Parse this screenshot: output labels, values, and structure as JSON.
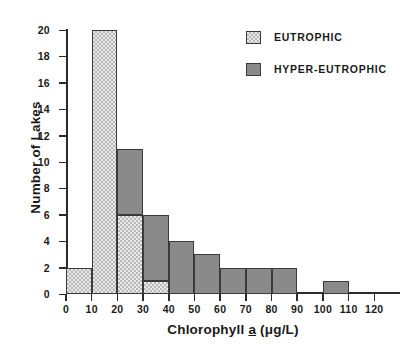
{
  "chart_data": {
    "type": "bar",
    "title": "",
    "subtitle": "",
    "xlabel": "Chlorophyll a (μg/L)",
    "xlabel_parts": {
      "prefix": "Chlorophyll ",
      "italic_underlined": "a",
      "suffix": " (μg/L)"
    },
    "ylabel": "Number of Lakes",
    "stacked": true,
    "grid": false,
    "legend_position": "top-right",
    "xlim": [
      0,
      130
    ],
    "ylim": [
      0,
      20
    ],
    "xticks": [
      0,
      10,
      20,
      30,
      40,
      50,
      60,
      70,
      80,
      90,
      100,
      110,
      120
    ],
    "xtick_labels": [
      "0",
      "10",
      "20",
      "30",
      "40",
      "50",
      "60",
      "70",
      "80",
      "90",
      "100",
      "110",
      "120"
    ],
    "yticks": [
      0,
      2,
      4,
      6,
      8,
      10,
      12,
      14,
      16,
      18,
      20
    ],
    "ytick_labels": [
      "0",
      "2",
      "4",
      "6",
      "8",
      "10",
      "12",
      "14",
      "16",
      "18",
      "20"
    ],
    "bin_width": 10,
    "bin_starts": [
      0,
      10,
      20,
      30,
      40,
      50,
      60,
      70,
      80,
      90,
      100,
      110
    ],
    "bin_labels": [
      "0-10",
      "10-20",
      "20-30",
      "30-40",
      "40-50",
      "50-60",
      "60-70",
      "70-80",
      "80-90",
      "90-100",
      "100-110",
      "110-120"
    ],
    "categories": [
      "0-10",
      "10-20",
      "20-30",
      "30-40",
      "40-50",
      "50-60",
      "60-70",
      "70-80",
      "80-90",
      "90-100",
      "100-110",
      "110-120"
    ],
    "series": [
      {
        "name": "EUTROPHIC",
        "color": "#e9e9e9",
        "pattern": "checkerboard",
        "values": [
          2,
          20,
          6,
          1,
          0,
          0,
          0,
          0,
          0,
          0,
          0,
          0
        ]
      },
      {
        "name": "HYPER-EUTROPHIC",
        "color": "#8a8a8a",
        "pattern": "solid",
        "values": [
          0,
          0,
          5,
          5,
          4,
          3,
          2,
          2,
          2,
          0,
          1,
          0
        ]
      }
    ],
    "totals": [
      2,
      20,
      11,
      6,
      4,
      3,
      2,
      2,
      2,
      0,
      1,
      0
    ]
  },
  "legend": {
    "entries": [
      {
        "label": "EUTROPHIC",
        "swatch": "checkerboard-swatch"
      },
      {
        "label": "HYPER-EUTROPHIC",
        "swatch": "solid-gray-swatch"
      }
    ]
  },
  "axes": {
    "x_title_prefix": "Chlorophyll ",
    "x_title_italic": "a",
    "x_title_suffix": " (μg/L)",
    "y_title": "Number of Lakes"
  },
  "caption": {
    "text": ""
  },
  "colors": {
    "axis": "#2b2b2b",
    "bar_outline": "#3a3a3a",
    "eutrophic_fill": "#e9e9e9",
    "eutrophic_hatch": "#b9b9b9",
    "hyper_eutrophic_fill": "#8a8a8a",
    "text": "#1a1a1a",
    "background": "#ffffff"
  }
}
